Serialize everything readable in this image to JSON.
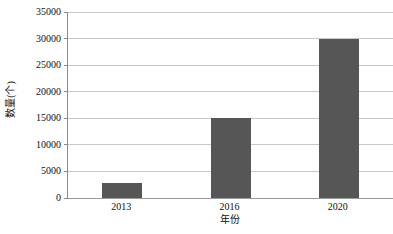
{
  "chart_data": {
    "type": "bar",
    "title": "",
    "subtitle": "",
    "xlabel": "年份",
    "ylabel": "数量(个)",
    "categories": [
      "2013",
      "2016",
      "2020"
    ],
    "values": [
      2800,
      15000,
      30000
    ],
    "series": [
      {
        "name": "数量(个)",
        "values": [
          2800,
          15000,
          30000
        ]
      }
    ],
    "ylim": [
      0,
      35000
    ],
    "ytick_values": [
      0,
      5000,
      10000,
      15000,
      20000,
      25000,
      30000,
      35000
    ],
    "ytick_labels": [
      "0",
      "5000",
      "10000",
      "15000",
      "20000",
      "25000",
      "30000",
      "35000"
    ],
    "xtick_labels": [
      "2013",
      "2016",
      "2020"
    ],
    "grid": true,
    "grid_axis": "y",
    "legend": false,
    "legend_position": "none",
    "bar_color": "#565656",
    "grid_color": "#c9c9c9",
    "axis_color": "#8a8a8a",
    "background_color": "#ffffff",
    "annotations": []
  }
}
